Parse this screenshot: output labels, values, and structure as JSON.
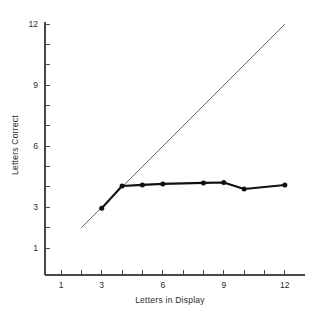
{
  "chart_data": {
    "type": "line",
    "title": "",
    "xlabel": "Letters in Display",
    "ylabel": "Letters Correct",
    "xlim": [
      0.2,
      13.0
    ],
    "ylim": [
      0.0,
      12.6
    ],
    "grid": false,
    "legend_position": "none",
    "x_ticks": [
      1,
      2,
      3,
      4,
      5,
      6,
      7,
      8,
      9,
      10,
      11,
      12
    ],
    "x_tick_labels": [
      "1",
      "",
      "3",
      "",
      "",
      "6",
      "",
      "",
      "9",
      "",
      "",
      "12"
    ],
    "y_ticks": [
      1,
      2,
      3,
      4,
      5,
      6,
      7,
      8,
      9,
      10,
      11,
      12
    ],
    "y_tick_labels": [
      "1",
      "",
      "3",
      "",
      "",
      "6",
      "",
      "",
      "9",
      "",
      "",
      "12"
    ],
    "series": [
      {
        "name": "Perfect performance (reference)",
        "style": "thin-line",
        "markers": false,
        "x": [
          2,
          12
        ],
        "values": [
          2,
          12
        ]
      },
      {
        "name": "Letters correct",
        "style": "thick-line-with-markers",
        "markers": true,
        "x": [
          3,
          4,
          5,
          6,
          8,
          9,
          10,
          12
        ],
        "values": [
          2.95,
          4.05,
          4.1,
          4.15,
          4.2,
          4.22,
          3.9,
          4.1
        ]
      }
    ]
  },
  "axis_titles": {
    "x": "Letters in Display",
    "y": "Letters Correct"
  },
  "tick_text": {
    "x_1": "1",
    "x_3": "3",
    "x_6": "6",
    "x_9": "9",
    "x_12": "12",
    "y_1": "1",
    "y_3": "3",
    "y_6": "6",
    "y_9": "9",
    "y_12": "12"
  },
  "colors": {
    "background": "#ffffff",
    "axis": "#4a4a4a",
    "reference_line": "#5a5a5a",
    "data_line": "#111111",
    "text": "#2b2b2b"
  }
}
